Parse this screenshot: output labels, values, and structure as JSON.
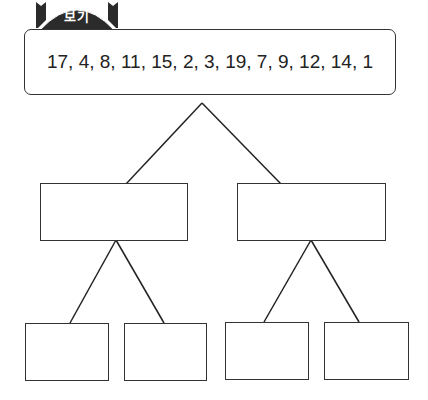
{
  "header": {
    "tab_label": "보기",
    "tab_color": "#2b2b2b"
  },
  "given": {
    "sequence": "17, 4, 8, 11, 15, 2, 3, 19, 7, 9, 12, 14, 1"
  },
  "tree": {
    "levels": [
      {
        "nodes": [
          {
            "id": "root",
            "label": ""
          }
        ]
      },
      {
        "nodes": [
          {
            "id": "mid-left",
            "label": ""
          },
          {
            "id": "mid-right",
            "label": ""
          }
        ]
      },
      {
        "nodes": [
          {
            "id": "leaf-1",
            "label": ""
          },
          {
            "id": "leaf-2",
            "label": ""
          },
          {
            "id": "leaf-3",
            "label": ""
          },
          {
            "id": "leaf-4",
            "label": ""
          }
        ]
      }
    ]
  }
}
